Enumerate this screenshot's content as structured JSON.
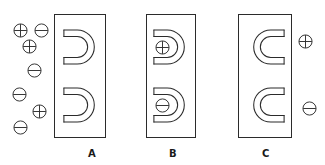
{
  "figure": {
    "title": "",
    "width": 325,
    "height": 165,
    "background_color": "#ffffff",
    "stroke_color": "#2b2b2b",
    "label_color": "#1a1a1a"
  },
  "panels": [
    {
      "id": "A",
      "label": "A",
      "label_x": 82,
      "label_y": 148,
      "box": {
        "x": 54,
        "y": 14,
        "width": 52,
        "height": 124
      },
      "magnets": [
        {
          "name": "horseshoe-magnet-top",
          "x": 62,
          "y": 26,
          "width": 38,
          "height": 42,
          "opening": "left"
        },
        {
          "name": "horseshoe-magnet-bottom",
          "x": 62,
          "y": 84,
          "width": 38,
          "height": 42,
          "opening": "left"
        }
      ],
      "charges": [
        {
          "sign": "+",
          "x": 13,
          "y": 23
        },
        {
          "sign": "-",
          "x": 34,
          "y": 23
        },
        {
          "sign": "+",
          "x": 22,
          "y": 39
        },
        {
          "sign": "-",
          "x": 27,
          "y": 63
        },
        {
          "sign": "-",
          "x": 12,
          "y": 87
        },
        {
          "sign": "+",
          "x": 32,
          "y": 104
        },
        {
          "sign": "-",
          "x": 13,
          "y": 120
        }
      ]
    },
    {
      "id": "B",
      "label": "B",
      "label_x": 163,
      "label_y": 148,
      "box": {
        "x": 146,
        "y": 14,
        "width": 50,
        "height": 124
      },
      "magnets": [
        {
          "name": "horseshoe-magnet-top",
          "x": 152,
          "y": 26,
          "width": 38,
          "height": 42,
          "opening": "left"
        },
        {
          "name": "horseshoe-magnet-bottom",
          "x": 152,
          "y": 84,
          "width": 38,
          "height": 42,
          "opening": "left"
        }
      ],
      "charges": [
        {
          "sign": "+",
          "x": 155,
          "y": 40
        },
        {
          "sign": "-",
          "x": 155,
          "y": 98
        }
      ]
    },
    {
      "id": "C",
      "label": "C",
      "label_x": 256,
      "label_y": 148,
      "box": {
        "x": 238,
        "y": 14,
        "width": 54,
        "height": 124
      },
      "magnets": [
        {
          "name": "horseshoe-magnet-top",
          "x": 248,
          "y": 26,
          "width": 38,
          "height": 42,
          "opening": "right"
        },
        {
          "name": "horseshoe-magnet-bottom",
          "x": 248,
          "y": 84,
          "width": 38,
          "height": 42,
          "opening": "right"
        }
      ],
      "charges": [
        {
          "sign": "+",
          "x": 298,
          "y": 34
        },
        {
          "sign": "-",
          "x": 302,
          "y": 101
        }
      ]
    }
  ],
  "icons": {
    "positive_charge": "plus-charge-icon",
    "negative_charge": "minus-charge-icon",
    "magnet": "horseshoe-magnet-icon"
  }
}
